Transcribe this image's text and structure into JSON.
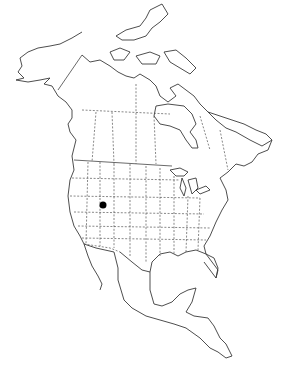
{
  "map": {
    "region": "North America",
    "style": "outline with dashed state/province borders",
    "background": "#ffffff",
    "line_color": "#3a3a3a",
    "markers": [
      {
        "label": "",
        "x": 103,
        "y": 205,
        "radius": 3.5,
        "color": "#000000"
      }
    ]
  }
}
